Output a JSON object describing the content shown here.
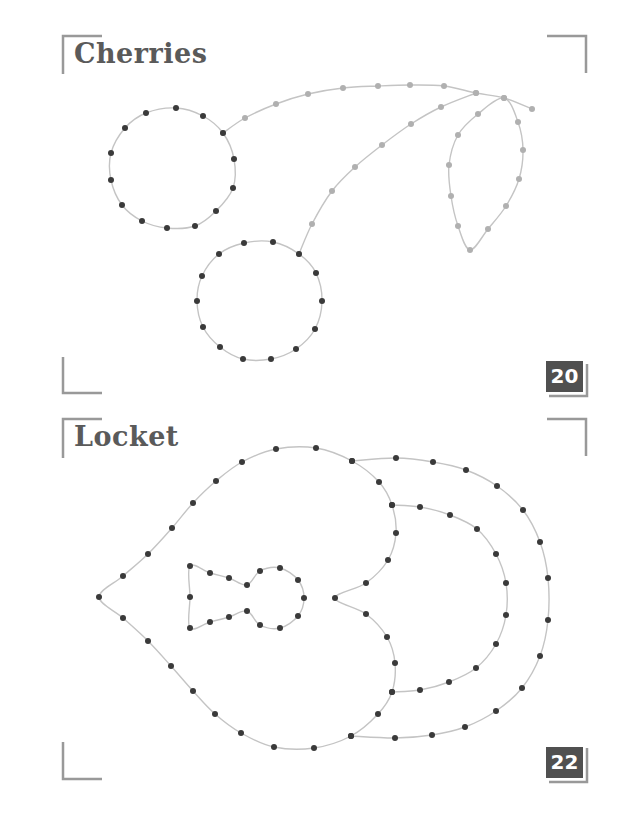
{
  "panels": [
    {
      "title": "Cherries",
      "page_number": "20",
      "colors": {
        "dot": "#3a3a3a",
        "stem_dot": "#b0b0b0",
        "line": "#c4c4c4",
        "bracket": "#999999"
      },
      "paths": {
        "cherry_left": [
          [
            146,
            113
          ],
          [
            176,
            108
          ],
          [
            203,
            116
          ],
          [
            223,
            133
          ],
          [
            234,
            159
          ],
          [
            233,
            188
          ],
          [
            216,
            211
          ],
          [
            195,
            226
          ],
          [
            167,
            228
          ],
          [
            142,
            221
          ],
          [
            122,
            205
          ],
          [
            111,
            180
          ],
          [
            111,
            153
          ],
          [
            125,
            128
          ]
        ],
        "cherry_right": [
          [
            244,
            243
          ],
          [
            273,
            242
          ],
          [
            299,
            254
          ],
          [
            316,
            273
          ],
          [
            322,
            301
          ],
          [
            315,
            329
          ],
          [
            296,
            349
          ],
          [
            271,
            359
          ],
          [
            243,
            359
          ],
          [
            220,
            347
          ],
          [
            203,
            327
          ],
          [
            197,
            301
          ],
          [
            202,
            276
          ],
          [
            219,
            254
          ]
        ],
        "stem_top": [
          [
            223,
            133
          ],
          [
            245,
            118
          ],
          [
            276,
            104
          ],
          [
            308,
            94
          ],
          [
            343,
            88
          ],
          [
            378,
            86
          ],
          [
            410,
            85
          ],
          [
            444,
            86
          ],
          [
            476,
            93
          ],
          [
            504,
            98
          ],
          [
            532,
            109
          ]
        ],
        "stem_lower": [
          [
            299,
            254
          ],
          [
            312,
            224
          ],
          [
            332,
            191
          ],
          [
            355,
            167
          ],
          [
            382,
            145
          ],
          [
            411,
            124
          ],
          [
            441,
            107
          ],
          [
            476,
            93
          ]
        ],
        "leaf": [
          [
            504,
            98
          ],
          [
            478,
            114
          ],
          [
            458,
            135
          ],
          [
            449,
            165
          ],
          [
            451,
            196
          ],
          [
            458,
            226
          ],
          [
            470,
            250
          ],
          [
            488,
            229
          ],
          [
            506,
            206
          ],
          [
            519,
            179
          ],
          [
            523,
            150
          ],
          [
            518,
            122
          ]
        ]
      }
    },
    {
      "title": "Locket",
      "page_number": "22",
      "colors": {
        "dot": "#3a3a3a",
        "line": "#c4c4c4",
        "bracket": "#999999"
      },
      "paths": {
        "heart": [
          [
            335,
            598
          ],
          [
            366,
            583
          ],
          [
            388,
            560
          ],
          [
            396,
            533
          ],
          [
            392,
            505
          ],
          [
            379,
            482
          ],
          [
            352,
            461
          ],
          [
            316,
            448
          ],
          [
            276,
            449
          ],
          [
            242,
            462
          ],
          [
            216,
            481
          ],
          [
            193,
            503
          ],
          [
            172,
            528
          ],
          [
            148,
            554
          ],
          [
            123,
            576
          ],
          [
            99,
            597
          ],
          [
            123,
            618
          ],
          [
            148,
            641
          ],
          [
            171,
            666
          ],
          [
            193,
            691
          ],
          [
            215,
            714
          ],
          [
            241,
            733
          ],
          [
            274,
            747
          ],
          [
            314,
            748
          ],
          [
            351,
            736
          ],
          [
            378,
            714
          ],
          [
            392,
            692
          ],
          [
            395,
            663
          ],
          [
            387,
            637
          ],
          [
            366,
            614
          ]
        ],
        "keyhole": [
          [
            190,
            566
          ],
          [
            210,
            573
          ],
          [
            229,
            578
          ],
          [
            247,
            585
          ],
          [
            260,
            571
          ],
          [
            280,
            568
          ],
          [
            298,
            580
          ],
          [
            304,
            598
          ],
          [
            298,
            616
          ],
          [
            280,
            628
          ],
          [
            260,
            625
          ],
          [
            247,
            611
          ],
          [
            229,
            617
          ],
          [
            210,
            622
          ],
          [
            190,
            628
          ],
          [
            190,
            597
          ]
        ],
        "outer_strap": [
          [
            352,
            461
          ],
          [
            396,
            458
          ],
          [
            433,
            462
          ],
          [
            466,
            470
          ],
          [
            497,
            486
          ],
          [
            523,
            510
          ],
          [
            540,
            542
          ],
          [
            548,
            578
          ],
          [
            548,
            620
          ],
          [
            540,
            656
          ],
          [
            522,
            688
          ],
          [
            496,
            711
          ],
          [
            465,
            727
          ],
          [
            432,
            735
          ],
          [
            395,
            738
          ],
          [
            351,
            736
          ]
        ],
        "inner_strap": [
          [
            392,
            505
          ],
          [
            420,
            507
          ],
          [
            450,
            515
          ],
          [
            477,
            529
          ],
          [
            496,
            554
          ],
          [
            506,
            583
          ],
          [
            506,
            615
          ],
          [
            496,
            644
          ],
          [
            476,
            668
          ],
          [
            449,
            682
          ],
          [
            420,
            690
          ],
          [
            392,
            692
          ]
        ]
      }
    }
  ]
}
